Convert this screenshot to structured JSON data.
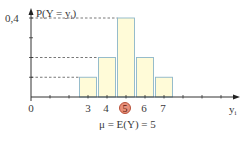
{
  "chart_data": {
    "type": "bar",
    "title": "",
    "ylabel": "P(Y = y_i)",
    "xlabel": "y_i",
    "categories": [
      "3",
      "4",
      "5",
      "6",
      "7"
    ],
    "x": [
      3,
      4,
      5,
      6,
      7
    ],
    "values": [
      0.1,
      0.2,
      0.4,
      0.2,
      0.1
    ],
    "ylim": [
      0,
      0.4
    ],
    "xlim": [
      0,
      10.5
    ],
    "y_tick_labels": [
      "0,4"
    ],
    "x_tick_labels": [
      "0",
      "3",
      "4",
      "5",
      "6",
      "7"
    ],
    "highlighted_category": "5",
    "annotation": "μ = E(Y) = 5",
    "grid": false,
    "dashed_guides_at": [
      0.1,
      0.2,
      0.4
    ],
    "colors": {
      "bar_fill": "#fffbd8",
      "bar_edge": "#8cb6c8",
      "axis": "#333333",
      "highlight": "#e8907a"
    }
  },
  "labels": {
    "y_axis": "P(Y = y",
    "y_axis_sub": "i",
    "y_axis_close": ")",
    "y_top_tick": "0,4",
    "x_axis": "y",
    "x_axis_sub": "i",
    "origin": "0",
    "x3": "3",
    "x4": "4",
    "x5": "5",
    "x6": "6",
    "x7": "7",
    "mean": "μ = E(Y) = 5"
  }
}
